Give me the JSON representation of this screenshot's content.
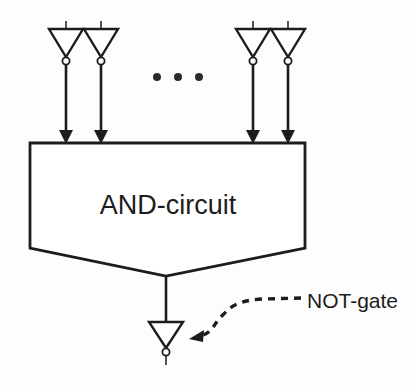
{
  "diagram": {
    "background_color": "#fdfdfd",
    "line_color": "#1c1c1c",
    "fill_color": "#ffffff",
    "box": {
      "label": "AND-circuit",
      "shape": "pentagon",
      "left": 30,
      "right": 305,
      "top": 143,
      "side_bottom": 248,
      "apex_x": 166,
      "apex_y": 276,
      "label_x": 168,
      "label_y": 214
    },
    "input_gates": [
      {
        "name": "not-gate-input-1",
        "cx": 66,
        "top": 29,
        "bottom": 57,
        "half_width": 17,
        "bubble_cy": 61,
        "bubble_r": 3.6,
        "stub_top": 21
      },
      {
        "name": "not-gate-input-2",
        "cx": 101,
        "top": 29,
        "bottom": 57,
        "half_width": 17,
        "bubble_cy": 61,
        "bubble_r": 3.6,
        "stub_top": 21
      },
      {
        "name": "not-gate-input-3",
        "cx": 253,
        "top": 29,
        "bottom": 57,
        "half_width": 17,
        "bubble_cy": 61,
        "bubble_r": 3.6,
        "stub_top": 21
      },
      {
        "name": "not-gate-input-4",
        "cx": 288,
        "top": 29,
        "bottom": 57,
        "half_width": 17,
        "bubble_cy": 61,
        "bubble_r": 3.6,
        "stub_top": 21
      }
    ],
    "input_wires": [
      {
        "name": "input-wire-1",
        "x": 66,
        "y1": 65,
        "y2": 143
      },
      {
        "name": "input-wire-2",
        "x": 101,
        "y1": 65,
        "y2": 143
      },
      {
        "name": "input-wire-3",
        "x": 253,
        "y1": 65,
        "y2": 143
      },
      {
        "name": "input-wire-4",
        "x": 288,
        "y1": 65,
        "y2": 143
      }
    ],
    "ellipsis": {
      "label": "...",
      "dots": [
        {
          "cx": 157,
          "cy": 77,
          "r": 4.0
        },
        {
          "cx": 178,
          "cy": 77,
          "r": 4.0
        },
        {
          "cx": 199,
          "cy": 77,
          "r": 4.0
        }
      ]
    },
    "output": {
      "wire": {
        "name": "output-wire",
        "x": 166,
        "y1": 276,
        "y2": 322
      },
      "gate": {
        "name": "not-gate-output",
        "cx": 166,
        "top": 322,
        "bottom": 348,
        "half_width": 17,
        "bubble_cy": 352,
        "bubble_r": 3.6,
        "stub_bottom": 364
      }
    },
    "callout": {
      "label": "NOT-gate",
      "label_x": 307,
      "label_y": 308,
      "arrow_tip_x": 190,
      "arrow_tip_y": 338,
      "path": "M 300 298 L 262 299 Q 238 300 227 309 Q 217 317 216 324 Q 213 333 202 336"
    }
  }
}
